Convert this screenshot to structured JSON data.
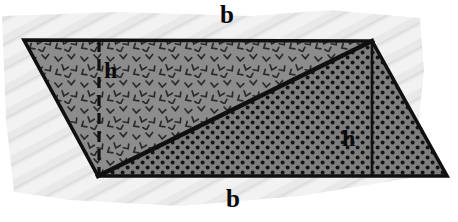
{
  "figure": {
    "kind": "geometry-diagram",
    "name": "parallelogram-split-into-two-triangles",
    "canvas": {
      "width": 458,
      "height": 222
    },
    "background": {
      "type": "paper-texture",
      "description": "light gray diagonally-striped torn paper patch behind the shape",
      "color": "#e8e8e8",
      "stripe_color": "#f4f4f4"
    },
    "shape": {
      "type": "parallelogram",
      "outline_color": "#101010",
      "outline_width": 3,
      "vertices": [
        {
          "name": "top-left",
          "x": 24,
          "y": 40
        },
        {
          "name": "top-right",
          "x": 372,
          "y": 41
        },
        {
          "name": "bottom-right",
          "x": 447,
          "y": 176
        },
        {
          "name": "bottom-left",
          "x": 98,
          "y": 176
        }
      ]
    },
    "diagonal": {
      "name": "diagonal-split",
      "from": {
        "x": 98,
        "y": 176
      },
      "to": {
        "x": 372,
        "y": 41
      },
      "color": "#101010",
      "width": 4
    },
    "regions": [
      {
        "name": "upper-left-triangle",
        "fill_color": "#8a8a8a",
        "pattern": "chevron-marks",
        "pattern_color": "#2e2e2e"
      },
      {
        "name": "lower-right-triangle",
        "fill_color": "#7d7d7d",
        "pattern": "dots-grid",
        "pattern_color": "#141414"
      }
    ],
    "height_lines": [
      {
        "name": "height-line-left",
        "style": "dashed",
        "x": 99,
        "y1": 41,
        "y2": 176,
        "color": "#101010",
        "label": "h"
      },
      {
        "name": "height-line-right",
        "style": "solid",
        "x": 372,
        "y1": 42,
        "y2": 176,
        "color": "#101010",
        "label": "h"
      }
    ]
  },
  "labels": {
    "base_top": "b",
    "base_bottom": "b",
    "height_left": "h",
    "height_right": "h"
  }
}
